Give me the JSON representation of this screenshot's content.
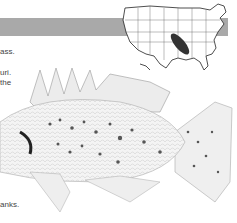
{
  "header": {
    "bar_color": "#a9a9a9"
  },
  "range_map": {
    "label": "United States range map",
    "highlight_region": "lower Mississippi valley",
    "highlight_color": "#333333"
  },
  "body_text": {
    "lines": [
      {
        "text": "ass.",
        "top": 47
      },
      {
        "text": "uri.",
        "top": 68
      },
      {
        "text": "the",
        "top": 78
      },
      {
        "text": "anks.",
        "top": 200
      }
    ]
  },
  "illustration": {
    "subject": "speckled sunfish (crappie) illustration"
  }
}
